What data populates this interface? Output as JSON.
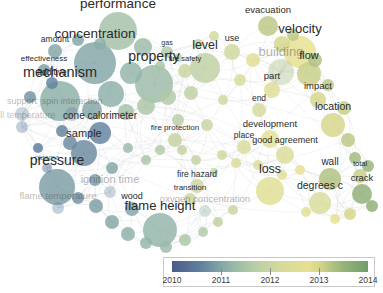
{
  "app": {
    "type": "term-co-occurrence-network-map",
    "background_color": "#ffffff",
    "width": 383,
    "height": 293
  },
  "chart_data": {
    "type": "scatter",
    "title": "",
    "xlabel": "",
    "ylabel": "",
    "grid": false,
    "legend_position": "bottom-right",
    "colormap": {
      "name": "blue-green-yellow-overlay-score",
      "stops": [
        "#4a5b8c",
        "#5f7f9e",
        "#8fb2a8",
        "#b9cfa5",
        "#d8dc9a",
        "#e8e08f",
        "#9db77a",
        "#6f9b6a"
      ]
    },
    "color_scale": {
      "label": "average publication year",
      "min": 2010,
      "max": 2014,
      "ticks": [
        2010,
        2011,
        2012,
        2013,
        2014
      ]
    },
    "nodes": [
      {
        "label": "performance",
        "x": 118,
        "y": 31,
        "size": 19,
        "weight": 95,
        "year": 2011.4,
        "font": 13.5,
        "opacity": 1.0
      },
      {
        "label": "concentration",
        "x": 95,
        "y": 63,
        "size": 21,
        "weight": 98,
        "year": 2011.0,
        "font": 13.5,
        "opacity": 1.0
      },
      {
        "label": "mechanism",
        "x": 60,
        "y": 101,
        "size": 20,
        "weight": 96,
        "year": 2011.1,
        "font": 14.5,
        "opacity": 1.0
      },
      {
        "label": "property",
        "x": 154,
        "y": 84,
        "size": 19,
        "weight": 92,
        "year": 2011.3,
        "font": 14.0,
        "opacity": 1.0
      },
      {
        "label": "pressure",
        "x": 57,
        "y": 187,
        "size": 18,
        "weight": 88,
        "year": 2010.9,
        "font": 14.0,
        "opacity": 1.0
      },
      {
        "label": "flame height",
        "x": 160,
        "y": 230,
        "size": 17,
        "weight": 84,
        "year": 2011.2,
        "font": 13.0,
        "opacity": 1.0
      },
      {
        "label": "velocity",
        "x": 300,
        "y": 52,
        "size": 16,
        "weight": 80,
        "year": 2012.8,
        "font": 13.0,
        "opacity": 1.0
      },
      {
        "label": "level",
        "x": 205,
        "y": 68,
        "size": 15,
        "weight": 76,
        "year": 2011.8,
        "font": 12.5,
        "opacity": 1.0
      },
      {
        "label": "loss",
        "x": 270,
        "y": 191,
        "size": 14,
        "weight": 70,
        "year": 2012.6,
        "font": 12.5,
        "opacity": 1.0
      },
      {
        "label": "flow",
        "x": 309,
        "y": 74,
        "size": 12,
        "weight": 62,
        "year": 2013.1,
        "font": 11.0,
        "opacity": 1.0
      },
      {
        "label": "sample",
        "x": 84,
        "y": 153,
        "size": 13,
        "weight": 64,
        "year": 2010.7,
        "font": 11.0,
        "opacity": 1.0
      },
      {
        "label": "cone calorimeter",
        "x": 100,
        "y": 133,
        "size": 11,
        "weight": 56,
        "year": 2010.6,
        "font": 10.0,
        "opacity": 1.0
      },
      {
        "label": "location",
        "x": 333,
        "y": 125,
        "size": 12,
        "weight": 60,
        "year": 2013.0,
        "font": 10.5,
        "opacity": 1.0
      },
      {
        "label": "evacuation",
        "x": 268,
        "y": 26,
        "size": 10,
        "weight": 50,
        "year": 2013.2,
        "font": 9.5,
        "opacity": 1.0
      },
      {
        "label": "building",
        "x": 281,
        "y": 72,
        "size": 13,
        "weight": 66,
        "year": 2013.4,
        "font": 13.0,
        "opacity": 0.35
      },
      {
        "label": "good agreement",
        "x": 285,
        "y": 155,
        "size": 9,
        "weight": 44,
        "year": 2012.4,
        "font": 9.0,
        "opacity": 1.0
      },
      {
        "label": "development",
        "x": 270,
        "y": 139,
        "size": 9,
        "weight": 44,
        "year": 2012.7,
        "font": 9.5,
        "opacity": 1.0
      },
      {
        "label": "degrees c",
        "x": 320,
        "y": 203,
        "size": 11,
        "weight": 54,
        "year": 2012.3,
        "font": 10.5,
        "opacity": 1.0
      },
      {
        "label": "wall",
        "x": 330,
        "y": 179,
        "size": 11,
        "weight": 54,
        "year": 2013.3,
        "font": 10.0,
        "opacity": 1.0
      },
      {
        "label": "crack",
        "x": 362,
        "y": 194,
        "size": 10,
        "weight": 50,
        "year": 2013.6,
        "font": 9.5,
        "opacity": 1.0
      },
      {
        "label": "total",
        "x": 360,
        "y": 176,
        "size": 7,
        "weight": 34,
        "year": 2013.1,
        "font": 7.5,
        "opacity": 1.0
      },
      {
        "label": "impact",
        "x": 318,
        "y": 100,
        "size": 8,
        "weight": 38,
        "year": 2013.0,
        "font": 9.5,
        "opacity": 1.0
      },
      {
        "label": "part",
        "x": 272,
        "y": 90,
        "size": 8,
        "weight": 38,
        "year": 2012.5,
        "font": 9.5,
        "opacity": 1.0
      },
      {
        "label": "end",
        "x": 259,
        "y": 110,
        "size": 7,
        "weight": 32,
        "year": 2012.2,
        "font": 8.5,
        "opacity": 1.0
      },
      {
        "label": "use",
        "x": 232,
        "y": 52,
        "size": 8,
        "weight": 36,
        "year": 2012.1,
        "font": 9.0,
        "opacity": 1.0
      },
      {
        "label": "fire safety",
        "x": 185,
        "y": 71,
        "size": 7,
        "weight": 32,
        "year": 2012.0,
        "font": 7.5,
        "opacity": 1.0
      },
      {
        "label": "gas",
        "x": 167,
        "y": 52,
        "size": 6,
        "weight": 28,
        "year": 2011.6,
        "font": 7.0,
        "opacity": 1.0
      },
      {
        "label": "fire protection",
        "x": 175,
        "y": 140,
        "size": 7,
        "weight": 32,
        "year": 2011.9,
        "font": 8.0,
        "opacity": 1.0
      },
      {
        "label": "place",
        "x": 244,
        "y": 147,
        "size": 7,
        "weight": 32,
        "year": 2012.3,
        "font": 8.5,
        "opacity": 1.0
      },
      {
        "label": "fire hazard",
        "x": 197,
        "y": 186,
        "size": 7,
        "weight": 32,
        "year": 2012.0,
        "font": 8.5,
        "opacity": 1.0
      },
      {
        "label": "transition",
        "x": 190,
        "y": 199,
        "size": 6,
        "weight": 28,
        "year": 2012.1,
        "font": 8.0,
        "opacity": 1.0
      },
      {
        "label": "amount",
        "x": 55,
        "y": 51,
        "size": 7,
        "weight": 32,
        "year": 2011.0,
        "font": 8.5,
        "opacity": 1.0
      },
      {
        "label": "effectiveness",
        "x": 44,
        "y": 70,
        "size": 6,
        "weight": 28,
        "year": 2010.9,
        "font": 8.0,
        "opacity": 1.0
      },
      {
        "label": "additive",
        "x": 52,
        "y": 83,
        "size": 6,
        "weight": 28,
        "year": 2010.6,
        "font": 8.5,
        "opacity": 1.0
      },
      {
        "label": "support",
        "x": 22,
        "y": 114,
        "size": 7,
        "weight": 30,
        "year": 2010.8,
        "font": 9.0,
        "opacity": 0.32
      },
      {
        "label": "spin interaction",
        "x": 72,
        "y": 114,
        "size": 7,
        "weight": 30,
        "year": 2010.7,
        "font": 9.0,
        "opacity": 0.32
      },
      {
        "label": "wall temperature",
        "x": 22,
        "y": 127,
        "size": 6,
        "weight": 26,
        "year": 2010.5,
        "font": 9.0,
        "opacity": 0.28
      },
      {
        "label": "plasma",
        "x": 47,
        "y": 168,
        "size": 5,
        "weight": 24,
        "year": 2010.4,
        "font": 7.5,
        "opacity": 0.6
      },
      {
        "label": "ignition time",
        "x": 110,
        "y": 192,
        "size": 6,
        "weight": 28,
        "year": 2010.8,
        "font": 11.0,
        "opacity": 0.35
      },
      {
        "label": "flame temperature",
        "x": 58,
        "y": 208,
        "size": 6,
        "weight": 26,
        "year": 2010.6,
        "font": 9.5,
        "opacity": 0.32
      },
      {
        "label": "wood",
        "x": 132,
        "y": 209,
        "size": 7,
        "weight": 30,
        "year": 2011.0,
        "font": 9.0,
        "opacity": 1.0
      },
      {
        "label": "oxygen concentration",
        "x": 205,
        "y": 211,
        "size": 6,
        "weight": 26,
        "year": 2011.2,
        "font": 9.5,
        "opacity": 0.35
      }
    ],
    "unlabeled_nodes": [
      {
        "x": 143,
        "y": 47,
        "size": 9,
        "year": 2011.3
      },
      {
        "x": 131,
        "y": 73,
        "size": 11,
        "year": 2011.2
      },
      {
        "x": 111,
        "y": 94,
        "size": 13,
        "year": 2011.1
      },
      {
        "x": 92,
        "y": 110,
        "size": 10,
        "year": 2011.0
      },
      {
        "x": 126,
        "y": 112,
        "size": 8,
        "year": 2011.4
      },
      {
        "x": 146,
        "y": 106,
        "size": 9,
        "year": 2011.5
      },
      {
        "x": 168,
        "y": 97,
        "size": 8,
        "year": 2011.6
      },
      {
        "x": 191,
        "y": 93,
        "size": 7,
        "year": 2011.8
      },
      {
        "x": 178,
        "y": 120,
        "size": 6,
        "year": 2011.7
      },
      {
        "x": 207,
        "y": 125,
        "size": 6,
        "year": 2012.0
      },
      {
        "x": 223,
        "y": 100,
        "size": 5,
        "year": 2012.1
      },
      {
        "x": 240,
        "y": 80,
        "size": 6,
        "year": 2012.3
      },
      {
        "x": 253,
        "y": 60,
        "size": 7,
        "year": 2012.6
      },
      {
        "x": 282,
        "y": 44,
        "size": 8,
        "year": 2013.0
      },
      {
        "x": 293,
        "y": 35,
        "size": 6,
        "year": 2013.2
      },
      {
        "x": 315,
        "y": 60,
        "size": 7,
        "year": 2013.3
      },
      {
        "x": 328,
        "y": 85,
        "size": 6,
        "year": 2013.2
      },
      {
        "x": 344,
        "y": 108,
        "size": 7,
        "year": 2013.1
      },
      {
        "x": 348,
        "y": 140,
        "size": 7,
        "year": 2013.2
      },
      {
        "x": 355,
        "y": 158,
        "size": 6,
        "year": 2013.4
      },
      {
        "x": 368,
        "y": 166,
        "size": 6,
        "year": 2013.5
      },
      {
        "x": 372,
        "y": 206,
        "size": 6,
        "year": 2013.6
      },
      {
        "x": 350,
        "y": 214,
        "size": 6,
        "year": 2013.0
      },
      {
        "x": 335,
        "y": 219,
        "size": 5,
        "year": 2012.8
      },
      {
        "x": 306,
        "y": 212,
        "size": 5,
        "year": 2012.6
      },
      {
        "x": 300,
        "y": 170,
        "size": 5,
        "year": 2012.8
      },
      {
        "x": 282,
        "y": 175,
        "size": 5,
        "year": 2012.6
      },
      {
        "x": 258,
        "y": 165,
        "size": 5,
        "year": 2012.4
      },
      {
        "x": 236,
        "y": 163,
        "size": 5,
        "year": 2012.3
      },
      {
        "x": 222,
        "y": 155,
        "size": 5,
        "year": 2012.1
      },
      {
        "x": 214,
        "y": 172,
        "size": 4,
        "year": 2012.0
      },
      {
        "x": 196,
        "y": 160,
        "size": 5,
        "year": 2011.9
      },
      {
        "x": 182,
        "y": 150,
        "size": 5,
        "year": 2011.9
      },
      {
        "x": 160,
        "y": 150,
        "size": 5,
        "year": 2011.6
      },
      {
        "x": 146,
        "y": 160,
        "size": 5,
        "year": 2011.5
      },
      {
        "x": 128,
        "y": 148,
        "size": 5,
        "year": 2011.3
      },
      {
        "x": 112,
        "y": 168,
        "size": 6,
        "year": 2011.0
      },
      {
        "x": 95,
        "y": 180,
        "size": 6,
        "year": 2010.9
      },
      {
        "x": 78,
        "y": 198,
        "size": 6,
        "year": 2010.8
      },
      {
        "x": 96,
        "y": 206,
        "size": 7,
        "year": 2010.9
      },
      {
        "x": 112,
        "y": 222,
        "size": 7,
        "year": 2011.0
      },
      {
        "x": 128,
        "y": 234,
        "size": 7,
        "year": 2011.1
      },
      {
        "x": 146,
        "y": 243,
        "size": 6,
        "year": 2011.2
      },
      {
        "x": 166,
        "y": 247,
        "size": 6,
        "year": 2011.3
      },
      {
        "x": 185,
        "y": 240,
        "size": 6,
        "year": 2011.5
      },
      {
        "x": 203,
        "y": 232,
        "size": 5,
        "year": 2011.6
      },
      {
        "x": 218,
        "y": 222,
        "size": 5,
        "year": 2011.8
      },
      {
        "x": 233,
        "y": 210,
        "size": 5,
        "year": 2012.0
      },
      {
        "x": 70,
        "y": 143,
        "size": 7,
        "year": 2010.7
      },
      {
        "x": 62,
        "y": 131,
        "size": 6,
        "year": 2010.6
      },
      {
        "x": 38,
        "y": 148,
        "size": 5,
        "year": 2010.5
      },
      {
        "x": 30,
        "y": 97,
        "size": 6,
        "year": 2010.8
      },
      {
        "x": 78,
        "y": 40,
        "size": 6,
        "year": 2011.0
      },
      {
        "x": 100,
        "y": 44,
        "size": 6,
        "year": 2011.1
      },
      {
        "x": 160,
        "y": 66,
        "size": 5,
        "year": 2011.5
      },
      {
        "x": 198,
        "y": 44,
        "size": 5,
        "year": 2011.9
      },
      {
        "x": 214,
        "y": 36,
        "size": 5,
        "year": 2012.2
      },
      {
        "x": 178,
        "y": 58,
        "size": 4,
        "year": 2011.7
      }
    ],
    "edges_style": {
      "color": "#b9bfc6",
      "opacity": 0.5,
      "curved": true,
      "width": 0.5
    }
  },
  "legend": {
    "title": "",
    "min_label": "2010",
    "max_label": "2014",
    "ticks": [
      "2010",
      "2011",
      "2012",
      "2013",
      "2014"
    ]
  }
}
